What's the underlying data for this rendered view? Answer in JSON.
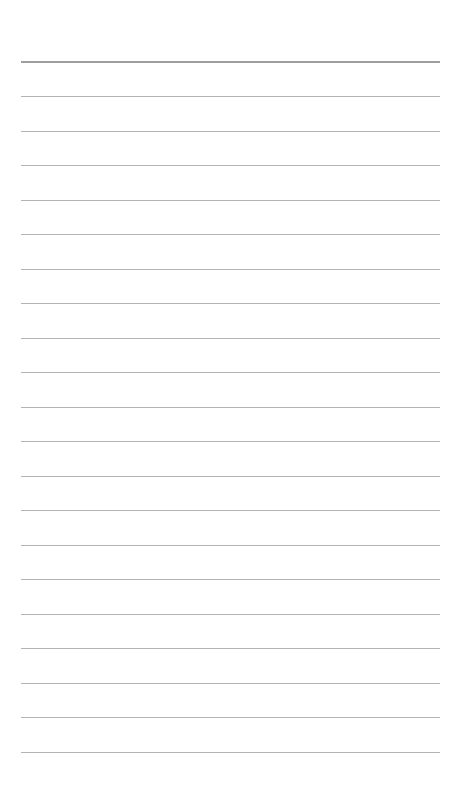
{
  "page": {
    "type": "ruled-notepaper",
    "background_color": "#ffffff",
    "header_rule": {
      "y": 61,
      "color": "#9e9e9e",
      "thickness": 2
    },
    "ruled_lines": {
      "count": 20,
      "first_y": 96,
      "spacing": 34.5,
      "color": "#b4b4b4",
      "thickness": 1,
      "x_start": 21,
      "x_end": 440
    },
    "text_content": []
  }
}
